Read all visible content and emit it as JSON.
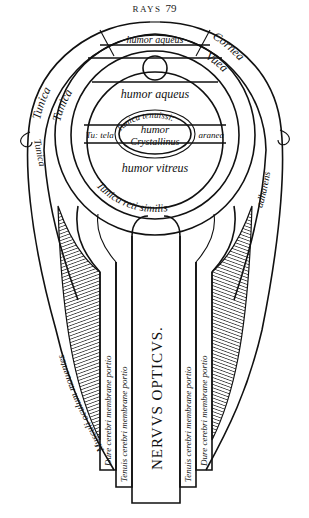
{
  "header": {
    "running_head": "RAYS",
    "page_number": "79"
  },
  "diagram": {
    "labels": {
      "cornea": "Cornea",
      "humor_aqueus_top": "humor aqueus",
      "tunica_outer_left": "Tunica",
      "tunica_inner_left": "Tunica",
      "uvea": "Vuea",
      "humor_aqueus": "humor aqueus",
      "tunica_tenuissima": "Tunica tenuissi:",
      "tunica_tela": "Tu: tela",
      "aranea": "aranea",
      "humor_crystallinus_1": "humor",
      "humor_crystallinus_2": "Crystallinus",
      "humor_vitreus": "humor vitreus",
      "tunica_reti_similis": "Tunica reti similis",
      "tunica_side": "Tunica",
      "adharens": "adharens",
      "musculi": "Musculi oculum mouentes",
      "nervus_opticus": "NERVVS OPTICVS.",
      "dure_left": "Dure cerebri membrane portio",
      "tenuis_left": "Tenuis cerebri membrane portio",
      "tenuis_right": "Tenuis cerebri membrane portio",
      "dure_right": "Dure cerebri membrane portio"
    }
  }
}
